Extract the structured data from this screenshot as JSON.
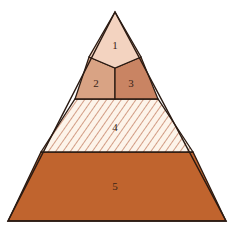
{
  "diagram": {
    "type": "pyramid",
    "levels": [
      {
        "id": 1,
        "label": "1",
        "color": "#f3d3c0",
        "pattern": "solid"
      },
      {
        "id": 2,
        "label": "2",
        "color": "#d9a384",
        "pattern": "solid"
      },
      {
        "id": 3,
        "label": "3",
        "color": "#c98463",
        "pattern": "solid"
      },
      {
        "id": 4,
        "label": "4",
        "color": "#fdf4ea",
        "pattern": "diagonal-hatch",
        "hatch_color": "#c0785a"
      },
      {
        "id": 5,
        "label": "5",
        "color": "#c0642e",
        "pattern": "solid"
      }
    ],
    "outline_color": "#2a1a12"
  }
}
